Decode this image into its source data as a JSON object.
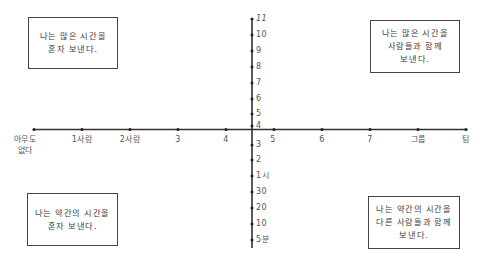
{
  "diagram": {
    "type": "quadrant-chart",
    "x_axis": {
      "description": "number of people",
      "ticks": [
        "아무도\n없다",
        "1사람",
        "2사람",
        "3",
        "4",
        "5",
        "6",
        "7",
        "그룹",
        "팀"
      ]
    },
    "y_axis": {
      "description": "amount of time",
      "ticks_top_to_bottom": [
        "11",
        "10",
        "9",
        "8",
        "7",
        "6",
        "5",
        "4",
        "3",
        "2",
        "1시",
        "30",
        "20",
        "10",
        "5분"
      ]
    },
    "quadrants": {
      "top_left": "나는 많은 시간을\n혼자 보낸다.",
      "top_right": "나는 많은 시간을\n사람들과 함께\n보낸다.",
      "bottom_left": "나는 약간의 시간을\n혼자 보낸다.",
      "bottom_right": "나는 약간의 시간을\n다른 사람들과 함께\n보낸다."
    },
    "colors": {
      "line": "#333333",
      "text": "#444444"
    }
  }
}
